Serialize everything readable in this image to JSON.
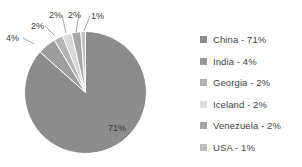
{
  "chart_data": {
    "type": "pie",
    "title": "",
    "categories": [
      "China",
      "India",
      "Georgia",
      "Iceland",
      "Venezuela",
      "USA"
    ],
    "values": [
      71,
      4,
      2,
      2,
      2,
      1
    ],
    "value_labels": [
      "71%",
      "4%",
      "2%",
      "2%",
      "2%",
      "1%"
    ],
    "colors": [
      "#8c8c8c",
      "#9e9e9e",
      "#b5b5b5",
      "#d8d8d8",
      "#a8a8a8",
      "#c0c0c0"
    ],
    "legend_position": "right",
    "grid": false,
    "xlabel": "",
    "ylabel": ""
  },
  "pie": {
    "center_x": 85.5,
    "center_y": 92.5,
    "radius": 61,
    "start_angle": -90,
    "inside_label": {
      "text": "71%",
      "x": 108,
      "y": 131
    },
    "callouts": [
      {
        "text": "4%",
        "tx": 6,
        "ty": 41,
        "lx1": 23,
        "ly1": 38,
        "lx2": 34,
        "ly2": 44
      },
      {
        "text": "2%",
        "tx": 31,
        "ty": 29,
        "lx1": 45,
        "ly1": 26,
        "lx2": 55,
        "ly2": 36
      },
      {
        "text": "2%",
        "tx": 49,
        "ty": 18,
        "lx1": 62,
        "ly1": 15,
        "lx2": 66,
        "ly2": 33
      },
      {
        "text": "2%",
        "tx": 68,
        "ty": 18,
        "lx1": 79,
        "ly1": 15,
        "lx2": 76,
        "ly2": 32
      },
      {
        "text": "1%",
        "tx": 91,
        "ty": 19,
        "lx1": 90,
        "ly1": 16,
        "lx2": 84,
        "ly2": 31
      }
    ]
  },
  "legend": {
    "items": [
      {
        "label": "China - 71%",
        "color": "#8c8c8c"
      },
      {
        "label": "India - 4%",
        "color": "#9a9a9a"
      },
      {
        "label": "Georgia - 2%",
        "color": "#b2b2b2"
      },
      {
        "label": "Iceland - 2%",
        "color": "#dcdcdc"
      },
      {
        "label": "Venezuela - 2%",
        "color": "#a6a6a6"
      },
      {
        "label": "USA - 1%",
        "color": "#bdbdbd"
      }
    ]
  }
}
